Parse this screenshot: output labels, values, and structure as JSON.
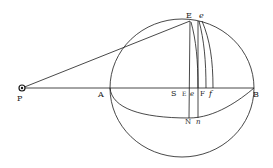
{
  "diagram": {
    "type": "geometric-astronomy-figure",
    "labels": {
      "P": "P",
      "A": "A",
      "B": "B",
      "E": "E",
      "e": "e",
      "S": "S",
      "E_small": "E",
      "e_small": "e",
      "F": "F",
      "f": "f",
      "N": "N",
      "n": "n"
    },
    "colors": {
      "ink": "#1a1a1a",
      "paper": "#ffffff"
    }
  }
}
